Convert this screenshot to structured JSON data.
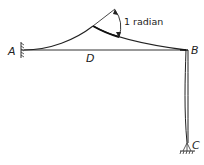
{
  "diagram": {
    "type": "structural-frame-deflection",
    "labels": {
      "A": "A",
      "B": "B",
      "C": "C",
      "D": "D"
    },
    "annotation": {
      "angle_text": "1 radian"
    },
    "supports": {
      "A": "fixed-wall",
      "C": "pinned"
    },
    "colors": {
      "line": "#222222",
      "background": "#ffffff"
    }
  }
}
